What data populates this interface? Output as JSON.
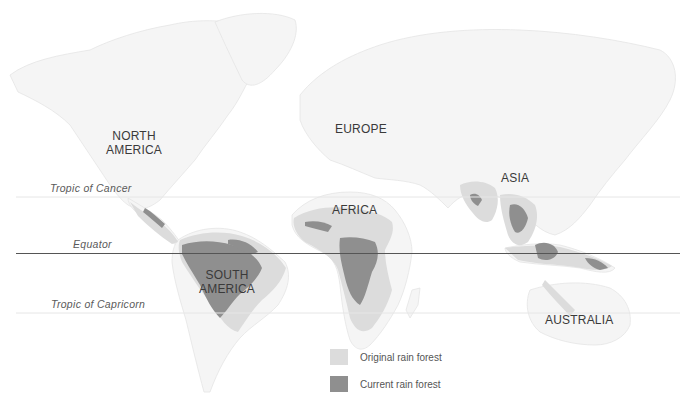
{
  "map": {
    "colors": {
      "background": "#ffffff",
      "land_outline": "#e6e6e6",
      "land_fill": "#f4f4f4",
      "original_rain_forest": "#dcdcdc",
      "current_rain_forest": "#8f8f8f",
      "equator_line": "#555555",
      "tropic_line": "#e8e8e8"
    },
    "continents": [
      {
        "id": "north-america",
        "label": "NORTH\nAMERICA"
      },
      {
        "id": "south-america",
        "label": "SOUTH\nAMERICA"
      },
      {
        "id": "europe",
        "label": "EUROPE"
      },
      {
        "id": "africa",
        "label": "AFRICA"
      },
      {
        "id": "asia",
        "label": "ASIA"
      },
      {
        "id": "australia",
        "label": "AUSTRALIA"
      }
    ],
    "latitude_lines": [
      {
        "id": "tropic-of-cancer",
        "label": "Tropic of Cancer"
      },
      {
        "id": "equator",
        "label": "Equator"
      },
      {
        "id": "tropic-of-capricorn",
        "label": "Tropic of Capricorn"
      }
    ],
    "legend": [
      {
        "label": "Original rain forest",
        "color": "#dcdcdc"
      },
      {
        "label": "Current rain forest",
        "color": "#8f8f8f"
      }
    ]
  }
}
